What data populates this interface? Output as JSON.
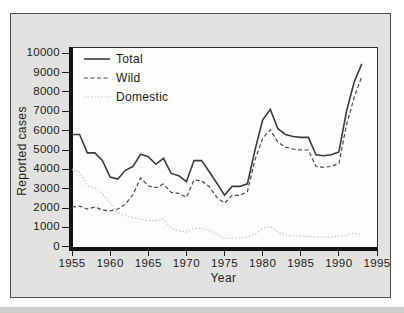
{
  "figure": {
    "y_axis_title": "Reported cases",
    "x_axis_title": "Year"
  },
  "colors": {
    "page_background": "#ffffff",
    "card_background": "#e2e2e0",
    "card_border": "#4d4d4d",
    "plot_background": "#fdfdfc",
    "axis_color": "#121212",
    "text_color": "#1c1c1c",
    "total_line": "#3c3c3c",
    "wild_line": "#4a4a4a",
    "domestic_line": "#bdbdb9"
  },
  "chart_data": {
    "type": "line",
    "xlabel": "Year",
    "ylabel": "Reported cases",
    "x_range": [
      1955,
      1995
    ],
    "y_range": [
      0,
      10000
    ],
    "x_ticks": [
      1955,
      1960,
      1965,
      1970,
      1975,
      1980,
      1985,
      1990,
      1995
    ],
    "y_ticks": [
      0,
      1000,
      2000,
      3000,
      4000,
      5000,
      6000,
      7000,
      8000,
      9000,
      10000
    ],
    "grid": false,
    "legend_position": "top-left-inside",
    "x": [
      1955,
      1956,
      1957,
      1958,
      1959,
      1960,
      1961,
      1962,
      1963,
      1964,
      1965,
      1966,
      1967,
      1968,
      1969,
      1970,
      1971,
      1972,
      1973,
      1974,
      1975,
      1976,
      1977,
      1978,
      1979,
      1980,
      1981,
      1982,
      1983,
      1984,
      1985,
      1986,
      1987,
      1988,
      1989,
      1990,
      1991,
      1992,
      1993
    ],
    "series": [
      {
        "name": "Total",
        "style": "solid",
        "color": "#3c3c3c",
        "values": [
          5800,
          5800,
          4850,
          4850,
          4450,
          3600,
          3500,
          3950,
          4150,
          4780,
          4650,
          4260,
          4570,
          3790,
          3670,
          3360,
          4450,
          4450,
          3880,
          3280,
          2670,
          3120,
          3120,
          3250,
          5000,
          6550,
          7100,
          6100,
          5800,
          5700,
          5650,
          5650,
          4750,
          4700,
          4750,
          4900,
          7000,
          8500,
          9450
        ]
      },
      {
        "name": "Wild",
        "style": "dashed",
        "color": "#4a4a4a",
        "values": [
          2050,
          2100,
          1950,
          2050,
          1900,
          1850,
          1950,
          2200,
          2700,
          3550,
          3150,
          3050,
          3240,
          2810,
          2760,
          2550,
          3450,
          3400,
          3100,
          2550,
          2250,
          2650,
          2650,
          2850,
          4500,
          5600,
          6050,
          5400,
          5150,
          5050,
          5000,
          5000,
          4150,
          4100,
          4150,
          4300,
          6300,
          7700,
          8800
        ]
      },
      {
        "name": "Domestic",
        "style": "dotted",
        "color": "#bdbdb9",
        "values": [
          4000,
          3850,
          3150,
          3050,
          2750,
          2250,
          1750,
          1600,
          1500,
          1420,
          1350,
          1350,
          1430,
          950,
          820,
          750,
          950,
          950,
          850,
          650,
          430,
          450,
          450,
          500,
          650,
          950,
          1050,
          760,
          600,
          560,
          550,
          540,
          500,
          490,
          500,
          550,
          590,
          720,
          560
        ]
      }
    ]
  }
}
